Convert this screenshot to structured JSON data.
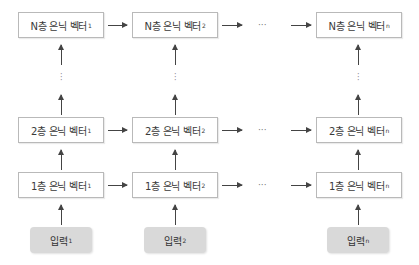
{
  "diagram": {
    "type": "stacked-rnn-unrolled",
    "columns": [
      {
        "index": "1",
        "input_label": "입력",
        "input_sub": "1"
      },
      {
        "index": "2",
        "input_label": "입력",
        "input_sub": "2"
      },
      {
        "index": "n",
        "input_label": "입력",
        "input_sub": "n"
      }
    ],
    "rows": [
      {
        "layer": "N층 은닉 벡터"
      },
      {
        "layer": "2층 은닉 벡터"
      },
      {
        "layer": "1층 은닉 벡터"
      }
    ],
    "nodes": {
      "r0c0": {
        "label": "N층 은닉 벡터",
        "sub": "1"
      },
      "r0c1": {
        "label": "N층 은닉 벡터",
        "sub": "2"
      },
      "r0c2": {
        "label": "N층 은닉 벡터",
        "sub": "n"
      },
      "r1c0": {
        "label": "2층 은닉 벡터",
        "sub": "1"
      },
      "r1c1": {
        "label": "2층 은닉 벡터",
        "sub": "2"
      },
      "r1c2": {
        "label": "2층 은닉 벡터",
        "sub": "n"
      },
      "r2c0": {
        "label": "1층 은닉 벡터",
        "sub": "1"
      },
      "r2c1": {
        "label": "1층 은닉 벡터",
        "sub": "2"
      },
      "r2c2": {
        "label": "1층 은닉 벡터",
        "sub": "n"
      }
    },
    "inputs": {
      "c0": {
        "label": "입력",
        "sub": "1"
      },
      "c1": {
        "label": "입력",
        "sub": "2"
      },
      "c2": {
        "label": "입력",
        "sub": "n"
      }
    },
    "ellipsis_horizontal": "···",
    "ellipsis_vertical": "⋮",
    "colors": {
      "node_border": "#b9b9b9",
      "node_fill": "#ffffff",
      "input_fill": "#d9d9d9",
      "arrow": "#444444",
      "text": "#333333"
    }
  }
}
